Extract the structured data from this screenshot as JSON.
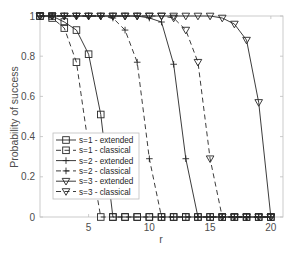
{
  "chart_data": {
    "type": "line",
    "title": "",
    "xlabel": "r",
    "ylabel": "Probability of success",
    "xlim": [
      1,
      21
    ],
    "ylim": [
      0,
      1
    ],
    "xticks": [
      5,
      10,
      15,
      20
    ],
    "yticks": [
      0,
      0.2,
      0.4,
      0.6,
      0.8,
      1
    ],
    "ytick_labels": [
      "0",
      "0.2",
      "0.4",
      "0.6",
      "0.8",
      "1"
    ],
    "xtick_labels": [
      "5",
      "10",
      "15",
      "20"
    ],
    "grid": false,
    "legend_position": "lower-left (inside)",
    "x": [
      1,
      2,
      3,
      4,
      5,
      6,
      7,
      8,
      9,
      10,
      11,
      12,
      13,
      14,
      15,
      16,
      17,
      18,
      19,
      20
    ],
    "series": [
      {
        "name": "s=1 - extended",
        "line": "solid",
        "marker": "square",
        "values": [
          1,
          1,
          0.97,
          0.93,
          0.81,
          0.51,
          0,
          0,
          0,
          0,
          0,
          0,
          0,
          0,
          0,
          0,
          0,
          0,
          0,
          0
        ]
      },
      {
        "name": "s=1 - classical",
        "line": "dashed",
        "marker": "square",
        "values": [
          1,
          0.99,
          0.94,
          0.77,
          0.35,
          0,
          0,
          0,
          0,
          0,
          0,
          0,
          0,
          0,
          0,
          0,
          0,
          0,
          0,
          0
        ]
      },
      {
        "name": "s=2 - extended",
        "line": "solid",
        "marker": "plus",
        "values": [
          1,
          1,
          1,
          1,
          1,
          1,
          1,
          1,
          1,
          0.99,
          0.97,
          0.76,
          0.29,
          0,
          0,
          0,
          0,
          0,
          0,
          0
        ]
      },
      {
        "name": "s=2 - classical",
        "line": "dashed",
        "marker": "plus",
        "values": [
          1,
          1,
          1,
          1,
          1,
          1,
          0.99,
          0.93,
          0.77,
          0.29,
          0,
          0,
          0,
          0,
          0,
          0,
          0,
          0,
          0,
          0
        ]
      },
      {
        "name": "s=3 - extended",
        "line": "solid",
        "marker": "triangle-down",
        "values": [
          1,
          1,
          1,
          1,
          1,
          1,
          1,
          1,
          1,
          1,
          1,
          1,
          1,
          1,
          1,
          0.99,
          0.96,
          0.88,
          0.57,
          0
        ]
      },
      {
        "name": "s=3 - classical",
        "line": "dashed",
        "marker": "triangle-down",
        "values": [
          1,
          1,
          1,
          1,
          1,
          1,
          1,
          1,
          1,
          1,
          1,
          0.99,
          0.93,
          0.77,
          0.29,
          0,
          0,
          0,
          0,
          0
        ]
      }
    ]
  },
  "colors": {
    "line": "#262626",
    "axis": "#bfbfbf",
    "tick_text": "#4d4d4d",
    "background": "#ffffff"
  }
}
